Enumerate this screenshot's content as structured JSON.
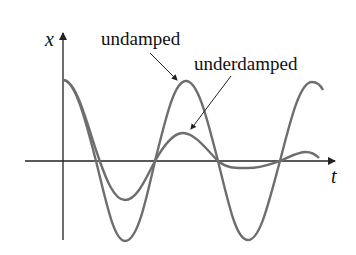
{
  "diagram": {
    "axis_labels": {
      "y": "x",
      "x": "t"
    },
    "curves": [
      {
        "name": "undamped",
        "label": "undamped",
        "color": "#6e6e6e"
      },
      {
        "name": "underdamped",
        "label": "underdamped",
        "color": "#6e6e6e"
      }
    ],
    "colors": {
      "axis": "#222222",
      "curve": "#6e6e6e",
      "text": "#111111"
    }
  }
}
